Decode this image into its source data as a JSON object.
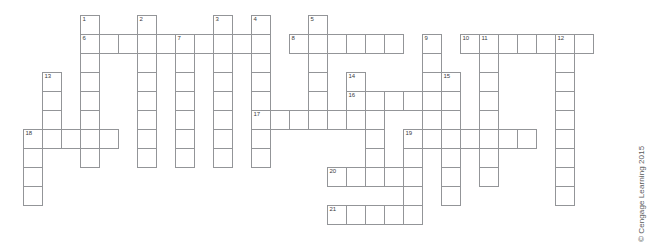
{
  "puzzle": {
    "title": "Crossword Puzzle Grid",
    "cell_size": 19,
    "grid_origin": {
      "x": 4,
      "y": 15
    },
    "line_color": "#939598",
    "cell_fill": "#ffffff",
    "number_color": "#3b3b3d",
    "entries": [
      {
        "number": "1",
        "direction": "down",
        "col": 4,
        "row": 0,
        "length": 8
      },
      {
        "number": "2",
        "direction": "down",
        "col": 7,
        "row": 0,
        "length": 8
      },
      {
        "number": "3",
        "direction": "down",
        "col": 11,
        "row": 0,
        "length": 8
      },
      {
        "number": "4",
        "direction": "down",
        "col": 13,
        "row": 0,
        "length": 8
      },
      {
        "number": "5",
        "direction": "down",
        "col": 16,
        "row": 0,
        "length": 5
      },
      {
        "number": "6",
        "direction": "across",
        "col": 4,
        "row": 1,
        "length": 10
      },
      {
        "number": "7",
        "direction": "down",
        "col": 9,
        "row": 1,
        "length": 7
      },
      {
        "number": "8",
        "direction": "across",
        "col": 15,
        "row": 1,
        "length": 6
      },
      {
        "number": "9",
        "direction": "down",
        "col": 22,
        "row": 1,
        "length": 6
      },
      {
        "number": "10",
        "direction": "across",
        "col": 24,
        "row": 1,
        "length": 6
      },
      {
        "number": "11",
        "direction": "down",
        "col": 25,
        "row": 1,
        "length": 8
      },
      {
        "number": "12",
        "direction": "down",
        "col": 29,
        "row": 1,
        "length": 9
      },
      {
        "number": "13",
        "direction": "down",
        "col": 2,
        "row": 3,
        "length": 6
      },
      {
        "number": "14",
        "direction": "down",
        "col": 18,
        "row": 3,
        "length": 4
      },
      {
        "number": "15",
        "direction": "down",
        "col": 23,
        "row": 3,
        "length": 6
      },
      {
        "number": "16",
        "direction": "across",
        "col": 18,
        "row": 4,
        "length": 5
      },
      {
        "number": "17",
        "direction": "across",
        "col": 13,
        "row": 5,
        "length": 7
      },
      {
        "number": "18",
        "direction": "across",
        "col": 1,
        "row": 6,
        "length": 5
      },
      {
        "number": "19",
        "direction": "across",
        "col": 21,
        "row": 6,
        "length": 7
      },
      {
        "number": "20",
        "direction": "across",
        "col": 17,
        "row": 8,
        "length": 5
      },
      {
        "number": "21",
        "direction": "across",
        "col": 17,
        "row": 10,
        "length": 5
      }
    ],
    "cells": [
      {
        "col": 4,
        "row": 0,
        "number": "1"
      },
      {
        "col": 7,
        "row": 0,
        "number": "2"
      },
      {
        "col": 11,
        "row": 0,
        "number": "3"
      },
      {
        "col": 13,
        "row": 0,
        "number": "4"
      },
      {
        "col": 16,
        "row": 0,
        "number": "5"
      },
      {
        "col": 4,
        "row": 1,
        "number": "6"
      },
      {
        "col": 5,
        "row": 1,
        "number": ""
      },
      {
        "col": 6,
        "row": 1,
        "number": ""
      },
      {
        "col": 7,
        "row": 1,
        "number": ""
      },
      {
        "col": 8,
        "row": 1,
        "number": ""
      },
      {
        "col": 9,
        "row": 1,
        "number": "7"
      },
      {
        "col": 10,
        "row": 1,
        "number": ""
      },
      {
        "col": 11,
        "row": 1,
        "number": ""
      },
      {
        "col": 12,
        "row": 1,
        "number": ""
      },
      {
        "col": 13,
        "row": 1,
        "number": ""
      },
      {
        "col": 15,
        "row": 1,
        "number": "8"
      },
      {
        "col": 16,
        "row": 1,
        "number": ""
      },
      {
        "col": 17,
        "row": 1,
        "number": ""
      },
      {
        "col": 18,
        "row": 1,
        "number": ""
      },
      {
        "col": 19,
        "row": 1,
        "number": ""
      },
      {
        "col": 20,
        "row": 1,
        "number": ""
      },
      {
        "col": 22,
        "row": 1,
        "number": "9"
      },
      {
        "col": 24,
        "row": 1,
        "number": "10"
      },
      {
        "col": 25,
        "row": 1,
        "number": "11"
      },
      {
        "col": 26,
        "row": 1,
        "number": ""
      },
      {
        "col": 27,
        "row": 1,
        "number": ""
      },
      {
        "col": 28,
        "row": 1,
        "number": ""
      },
      {
        "col": 29,
        "row": 1,
        "number": "12"
      },
      {
        "col": 30,
        "row": 1,
        "number": ""
      },
      {
        "col": 4,
        "row": 2,
        "number": ""
      },
      {
        "col": 7,
        "row": 2,
        "number": ""
      },
      {
        "col": 9,
        "row": 2,
        "number": ""
      },
      {
        "col": 11,
        "row": 2,
        "number": ""
      },
      {
        "col": 13,
        "row": 2,
        "number": ""
      },
      {
        "col": 16,
        "row": 2,
        "number": ""
      },
      {
        "col": 22,
        "row": 2,
        "number": ""
      },
      {
        "col": 25,
        "row": 2,
        "number": ""
      },
      {
        "col": 29,
        "row": 2,
        "number": ""
      },
      {
        "col": 2,
        "row": 3,
        "number": "13"
      },
      {
        "col": 4,
        "row": 3,
        "number": ""
      },
      {
        "col": 7,
        "row": 3,
        "number": ""
      },
      {
        "col": 9,
        "row": 3,
        "number": ""
      },
      {
        "col": 11,
        "row": 3,
        "number": ""
      },
      {
        "col": 13,
        "row": 3,
        "number": ""
      },
      {
        "col": 16,
        "row": 3,
        "number": ""
      },
      {
        "col": 18,
        "row": 3,
        "number": "14"
      },
      {
        "col": 22,
        "row": 3,
        "number": ""
      },
      {
        "col": 23,
        "row": 3,
        "number": "15"
      },
      {
        "col": 25,
        "row": 3,
        "number": ""
      },
      {
        "col": 29,
        "row": 3,
        "number": ""
      },
      {
        "col": 2,
        "row": 4,
        "number": ""
      },
      {
        "col": 4,
        "row": 4,
        "number": ""
      },
      {
        "col": 7,
        "row": 4,
        "number": ""
      },
      {
        "col": 9,
        "row": 4,
        "number": ""
      },
      {
        "col": 11,
        "row": 4,
        "number": ""
      },
      {
        "col": 13,
        "row": 4,
        "number": ""
      },
      {
        "col": 16,
        "row": 4,
        "number": ""
      },
      {
        "col": 18,
        "row": 4,
        "number": "16"
      },
      {
        "col": 19,
        "row": 4,
        "number": ""
      },
      {
        "col": 20,
        "row": 4,
        "number": ""
      },
      {
        "col": 21,
        "row": 4,
        "number": ""
      },
      {
        "col": 22,
        "row": 4,
        "number": ""
      },
      {
        "col": 23,
        "row": 4,
        "number": ""
      },
      {
        "col": 25,
        "row": 4,
        "number": ""
      },
      {
        "col": 29,
        "row": 4,
        "number": ""
      },
      {
        "col": 2,
        "row": 5,
        "number": ""
      },
      {
        "col": 4,
        "row": 5,
        "number": ""
      },
      {
        "col": 7,
        "row": 5,
        "number": ""
      },
      {
        "col": 9,
        "row": 5,
        "number": ""
      },
      {
        "col": 11,
        "row": 5,
        "number": ""
      },
      {
        "col": 13,
        "row": 5,
        "number": "17"
      },
      {
        "col": 14,
        "row": 5,
        "number": ""
      },
      {
        "col": 15,
        "row": 5,
        "number": ""
      },
      {
        "col": 16,
        "row": 5,
        "number": ""
      },
      {
        "col": 17,
        "row": 5,
        "number": ""
      },
      {
        "col": 18,
        "row": 5,
        "number": ""
      },
      {
        "col": 19,
        "row": 5,
        "number": ""
      },
      {
        "col": 22,
        "row": 5,
        "number": ""
      },
      {
        "col": 23,
        "row": 5,
        "number": ""
      },
      {
        "col": 25,
        "row": 5,
        "number": ""
      },
      {
        "col": 29,
        "row": 5,
        "number": ""
      },
      {
        "col": 1,
        "row": 6,
        "number": "18"
      },
      {
        "col": 2,
        "row": 6,
        "number": ""
      },
      {
        "col": 3,
        "row": 6,
        "number": ""
      },
      {
        "col": 4,
        "row": 6,
        "number": ""
      },
      {
        "col": 5,
        "row": 6,
        "number": ""
      },
      {
        "col": 7,
        "row": 6,
        "number": ""
      },
      {
        "col": 9,
        "row": 6,
        "number": ""
      },
      {
        "col": 11,
        "row": 6,
        "number": ""
      },
      {
        "col": 13,
        "row": 6,
        "number": ""
      },
      {
        "col": 19,
        "row": 6,
        "number": ""
      },
      {
        "col": 21,
        "row": 6,
        "number": "19"
      },
      {
        "col": 22,
        "row": 6,
        "number": ""
      },
      {
        "col": 23,
        "row": 6,
        "number": ""
      },
      {
        "col": 24,
        "row": 6,
        "number": ""
      },
      {
        "col": 25,
        "row": 6,
        "number": ""
      },
      {
        "col": 26,
        "row": 6,
        "number": ""
      },
      {
        "col": 27,
        "row": 6,
        "number": ""
      },
      {
        "col": 29,
        "row": 6,
        "number": ""
      },
      {
        "col": 1,
        "row": 7,
        "number": ""
      },
      {
        "col": 4,
        "row": 7,
        "number": ""
      },
      {
        "col": 7,
        "row": 7,
        "number": ""
      },
      {
        "col": 9,
        "row": 7,
        "number": ""
      },
      {
        "col": 11,
        "row": 7,
        "number": ""
      },
      {
        "col": 13,
        "row": 7,
        "number": ""
      },
      {
        "col": 19,
        "row": 7,
        "number": ""
      },
      {
        "col": 21,
        "row": 7,
        "number": ""
      },
      {
        "col": 23,
        "row": 7,
        "number": ""
      },
      {
        "col": 25,
        "row": 7,
        "number": ""
      },
      {
        "col": 29,
        "row": 7,
        "number": ""
      },
      {
        "col": 1,
        "row": 8,
        "number": ""
      },
      {
        "col": 17,
        "row": 8,
        "number": "20"
      },
      {
        "col": 18,
        "row": 8,
        "number": ""
      },
      {
        "col": 19,
        "row": 8,
        "number": ""
      },
      {
        "col": 20,
        "row": 8,
        "number": ""
      },
      {
        "col": 21,
        "row": 8,
        "number": ""
      },
      {
        "col": 23,
        "row": 8,
        "number": ""
      },
      {
        "col": 25,
        "row": 8,
        "number": ""
      },
      {
        "col": 29,
        "row": 8,
        "number": ""
      },
      {
        "col": 1,
        "row": 9,
        "number": ""
      },
      {
        "col": 21,
        "row": 9,
        "number": ""
      },
      {
        "col": 23,
        "row": 9,
        "number": ""
      },
      {
        "col": 29,
        "row": 9,
        "number": ""
      },
      {
        "col": 17,
        "row": 10,
        "number": "21"
      },
      {
        "col": 18,
        "row": 10,
        "number": ""
      },
      {
        "col": 19,
        "row": 10,
        "number": ""
      },
      {
        "col": 20,
        "row": 10,
        "number": ""
      },
      {
        "col": 21,
        "row": 10,
        "number": ""
      }
    ]
  },
  "credit": {
    "text": "© Cengage Learning 2015"
  }
}
